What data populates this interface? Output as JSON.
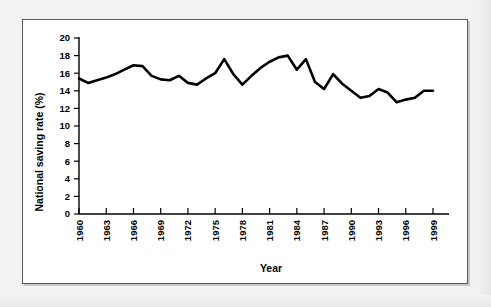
{
  "figure": {
    "background_color": "#ffffff",
    "page_background_color": "#f2f2f2",
    "border_color": "#5a5a5a",
    "line_color": "#000000"
  },
  "chart_data": {
    "type": "line",
    "title": "",
    "xlabel": "Year",
    "ylabel": "National saving rate (%)",
    "xlim": [
      1960,
      1999
    ],
    "ylim": [
      0,
      20
    ],
    "grid": false,
    "legend": null,
    "ytick_labels": [
      "0",
      "2",
      "4",
      "6",
      "8",
      "10",
      "12",
      "14",
      "16",
      "18",
      "20"
    ],
    "ytick_values": [
      0,
      2,
      4,
      6,
      8,
      10,
      12,
      14,
      16,
      18,
      20
    ],
    "xtick_labels": [
      "1960",
      "1963",
      "1966",
      "1969",
      "1972",
      "1975",
      "1978",
      "1981",
      "1984",
      "1987",
      "1990",
      "1993",
      "1996",
      "1999"
    ],
    "xtick_values": [
      1960,
      1963,
      1966,
      1969,
      1972,
      1975,
      1978,
      1981,
      1984,
      1987,
      1990,
      1993,
      1996,
      1999
    ],
    "x": [
      1960,
      1961,
      1962,
      1963,
      1964,
      1965,
      1966,
      1967,
      1968,
      1969,
      1970,
      1971,
      1972,
      1973,
      1974,
      1975,
      1976,
      1977,
      1978,
      1979,
      1980,
      1981,
      1982,
      1983,
      1984,
      1985,
      1986,
      1987,
      1988,
      1989,
      1990,
      1991,
      1992,
      1993,
      1994,
      1995,
      1996,
      1997,
      1998,
      1999
    ],
    "values": [
      15.4,
      14.9,
      15.2,
      15.5,
      15.9,
      16.4,
      16.9,
      16.8,
      15.7,
      15.3,
      15.2,
      15.7,
      14.9,
      14.7,
      15.4,
      16.0,
      17.6,
      15.9,
      14.7,
      15.7,
      16.6,
      17.3,
      17.8,
      18.0,
      16.4,
      17.6,
      15.0,
      14.2,
      15.9,
      14.8,
      14.0,
      13.2,
      13.4,
      14.2,
      13.8,
      12.7,
      13.0,
      13.2,
      14.0,
      14.0
    ],
    "series_name": "National saving rate"
  },
  "labels": {
    "x_axis_title": "Year",
    "y_axis_title": "National saving rate (%)"
  }
}
